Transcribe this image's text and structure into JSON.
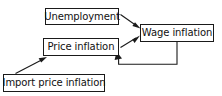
{
  "diagram": {
    "background_color": "#ffffff",
    "line_color": "#1a1a1a",
    "text_color": "#111111",
    "nodes": [
      {
        "id": "unemployment",
        "label": "Unemployment",
        "x": 45,
        "y": 8,
        "width": 74,
        "height": 17
      },
      {
        "id": "wage_inflation",
        "label": "Wage inflation",
        "x": 140,
        "y": 24,
        "width": 74,
        "height": 18
      },
      {
        "id": "price_inflation",
        "label": "Price inflation",
        "x": 43,
        "y": 38,
        "width": 76,
        "height": 18
      },
      {
        "id": "import_price_inflation",
        "label": "Import price inflation",
        "x": 3,
        "y": 74,
        "width": 102,
        "height": 18
      }
    ],
    "edges": [
      {
        "id": "unemployment-to-wage-inflation",
        "from": "unemployment",
        "to": "wage_inflation",
        "style": "straight-diagonal",
        "arrowhead": "filled-triangle"
      },
      {
        "id": "price-inflation-to-wage-inflation",
        "from": "price_inflation",
        "to": "wage_inflation",
        "style": "straight-diagonal",
        "arrowhead": "filled-triangle"
      },
      {
        "id": "wage-inflation-to-price-inflation-feedback",
        "from": "wage_inflation",
        "to": "price_inflation",
        "style": "orthogonal-feedback-loop",
        "arrowhead": "filled-triangle"
      },
      {
        "id": "import-price-inflation-to-price-inflation",
        "from": "import_price_inflation",
        "to": "price_inflation",
        "style": "straight-diagonal",
        "arrowhead": "filled-triangle"
      }
    ]
  }
}
